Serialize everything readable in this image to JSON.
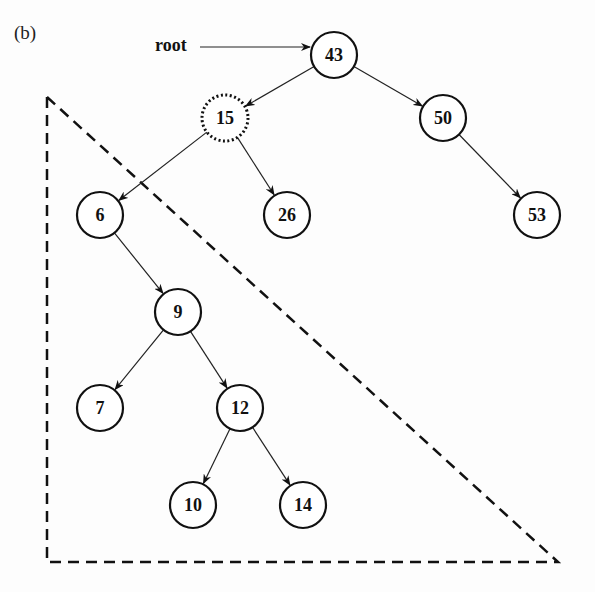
{
  "figure": {
    "label": "(b)",
    "root_label": "root",
    "colors": {
      "stroke": "#111111",
      "background": "#fdfdfd"
    }
  },
  "tree": {
    "nodes": [
      {
        "id": "n43",
        "value": "43",
        "x": 334,
        "y": 55,
        "style": "solid"
      },
      {
        "id": "n15",
        "value": "15",
        "x": 225,
        "y": 118,
        "style": "dotted"
      },
      {
        "id": "n50",
        "value": "50",
        "x": 443,
        "y": 118,
        "style": "solid"
      },
      {
        "id": "n6",
        "value": "6",
        "x": 100,
        "y": 215,
        "style": "solid"
      },
      {
        "id": "n26",
        "value": "26",
        "x": 287,
        "y": 215,
        "style": "solid"
      },
      {
        "id": "n53",
        "value": "53",
        "x": 537,
        "y": 215,
        "style": "solid"
      },
      {
        "id": "n9",
        "value": "9",
        "x": 178,
        "y": 312,
        "style": "solid"
      },
      {
        "id": "n7",
        "value": "7",
        "x": 100,
        "y": 408,
        "style": "solid"
      },
      {
        "id": "n12",
        "value": "12",
        "x": 240,
        "y": 408,
        "style": "solid"
      },
      {
        "id": "n10",
        "value": "10",
        "x": 193,
        "y": 505,
        "style": "solid"
      },
      {
        "id": "n14",
        "value": "14",
        "x": 303,
        "y": 505,
        "style": "solid"
      }
    ],
    "edges": [
      [
        "n43",
        "n15"
      ],
      [
        "n43",
        "n50"
      ],
      [
        "n15",
        "n6"
      ],
      [
        "n15",
        "n26"
      ],
      [
        "n50",
        "n53"
      ],
      [
        "n6",
        "n9"
      ],
      [
        "n9",
        "n7"
      ],
      [
        "n9",
        "n12"
      ],
      [
        "n12",
        "n10"
      ],
      [
        "n12",
        "n14"
      ]
    ],
    "root_pointer": {
      "from": [
        200,
        47
      ],
      "to": "n43"
    },
    "subtree_triangle": {
      "points": [
        [
          47,
          97
        ],
        [
          47,
          562
        ],
        [
          558,
          562
        ]
      ],
      "style": "dashed"
    }
  }
}
